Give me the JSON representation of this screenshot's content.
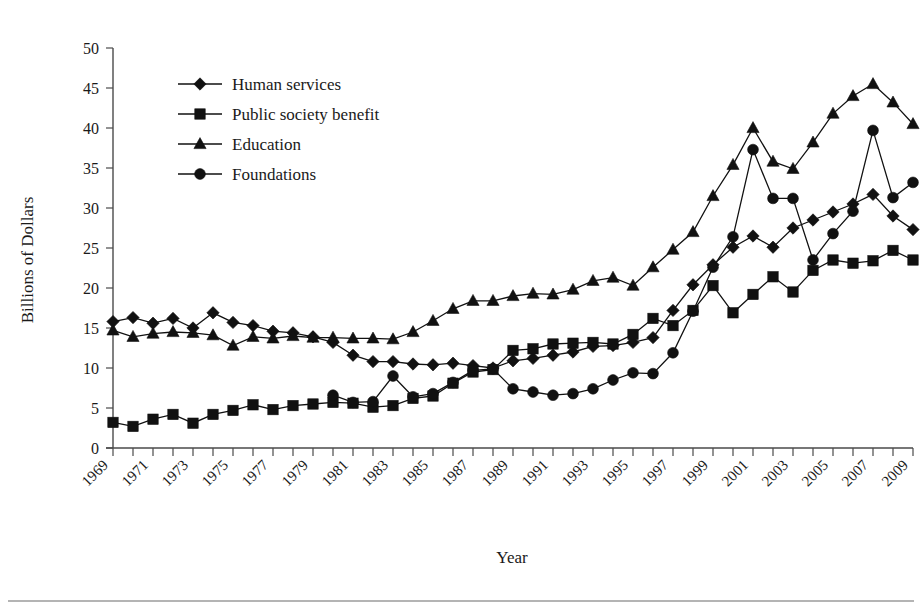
{
  "chart_data": {
    "type": "line",
    "title": "",
    "xlabel": "Year",
    "ylabel": "Billions of Dollars",
    "xlim": [
      1969,
      2009
    ],
    "ylim": [
      0,
      50
    ],
    "yticks": [
      0,
      5,
      10,
      15,
      20,
      25,
      30,
      35,
      40,
      45,
      50
    ],
    "grid": false,
    "legend_position": "upper-left-inside",
    "x": [
      1969,
      1970,
      1971,
      1972,
      1973,
      1974,
      1975,
      1976,
      1977,
      1978,
      1979,
      1980,
      1981,
      1982,
      1983,
      1984,
      1985,
      1986,
      1987,
      1988,
      1989,
      1990,
      1991,
      1992,
      1993,
      1994,
      1995,
      1996,
      1997,
      1998,
      1999,
      2000,
      2001,
      2002,
      2003,
      2004,
      2005,
      2006,
      2007,
      2008,
      2009
    ],
    "tick_labels": [
      "1969",
      "1971",
      "1973",
      "1975",
      "1977",
      "1979",
      "1981",
      "1983",
      "1985",
      "1987",
      "1989",
      "1991",
      "1993",
      "1995",
      "1997",
      "1999",
      "2001",
      "2003",
      "2005",
      "2007",
      "2009"
    ],
    "series": [
      {
        "name": "Human services",
        "marker": "diamond",
        "values": [
          15.8,
          16.3,
          15.6,
          16.2,
          15.0,
          16.9,
          15.7,
          15.3,
          14.6,
          14.4,
          13.9,
          13.2,
          11.6,
          10.8,
          10.8,
          10.5,
          10.4,
          10.6,
          10.3,
          10.0,
          10.9,
          11.2,
          11.6,
          12.0,
          12.7,
          12.8,
          13.2,
          13.8,
          17.2,
          20.4,
          22.9,
          25.1,
          26.5,
          25.1,
          27.5,
          28.5,
          29.5,
          30.5,
          31.7,
          29.0,
          27.3
        ]
      },
      {
        "name": "Public society benefit",
        "marker": "square",
        "values": [
          3.2,
          2.7,
          3.6,
          4.2,
          3.1,
          4.2,
          4.7,
          5.4,
          4.8,
          5.3,
          5.5,
          5.7,
          5.6,
          5.1,
          5.3,
          6.2,
          6.5,
          8.1,
          9.5,
          9.8,
          12.2,
          12.4,
          13.0,
          13.1,
          13.2,
          13.0,
          14.2,
          16.2,
          15.3,
          17.2,
          20.3,
          16.9,
          19.2,
          21.4,
          19.5,
          22.2,
          23.5,
          23.1,
          23.4,
          24.7,
          23.5
        ]
      },
      {
        "name": "Education",
        "marker": "triangle",
        "values": [
          14.7,
          13.9,
          14.3,
          14.5,
          14.4,
          14.1,
          12.8,
          13.9,
          13.7,
          14.0,
          13.8,
          13.8,
          13.7,
          13.7,
          13.6,
          14.5,
          15.9,
          17.4,
          18.4,
          18.4,
          19.0,
          19.3,
          19.2,
          19.8,
          20.9,
          21.3,
          20.3,
          22.6,
          24.8,
          27.0,
          31.5,
          35.4,
          40.0,
          35.8,
          34.9,
          38.2,
          41.8,
          44.0,
          45.5,
          43.2,
          40.5
        ]
      },
      {
        "name": "Foundations",
        "marker": "circle",
        "values": [
          null,
          null,
          null,
          null,
          null,
          null,
          null,
          null,
          null,
          null,
          null,
          6.6,
          5.7,
          5.8,
          9.0,
          6.4,
          6.8,
          8.2,
          9.7,
          9.9,
          7.4,
          7.0,
          6.6,
          6.8,
          7.4,
          8.5,
          9.4,
          9.3,
          11.9,
          17.1,
          22.6,
          26.4,
          37.3,
          31.2,
          31.2,
          23.5,
          26.8,
          29.6,
          39.7,
          31.3,
          33.2
        ]
      }
    ]
  },
  "axes": {
    "y_title": "Billions of Dollars",
    "x_title": "Year"
  }
}
